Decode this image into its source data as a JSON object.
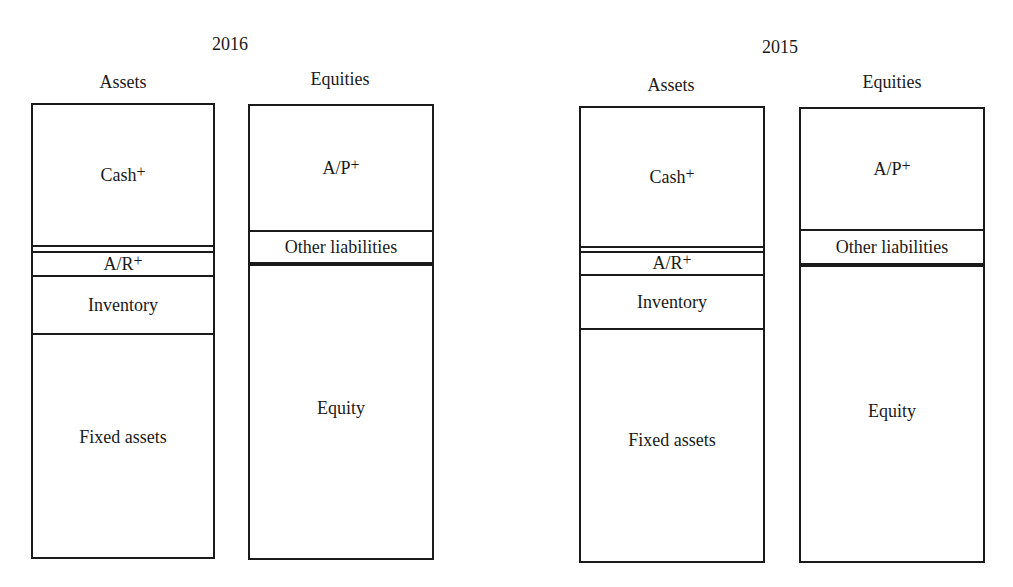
{
  "panels": [
    {
      "year": "2016",
      "assets": {
        "title": "Assets",
        "segments": [
          {
            "label": "Cash",
            "mark": "+"
          },
          {
            "label": "A/R",
            "mark": "+"
          },
          {
            "label": "Inventory",
            "mark": ""
          },
          {
            "label": "Fixed assets",
            "mark": ""
          }
        ]
      },
      "equities": {
        "title": "Equities",
        "segments": [
          {
            "label": "A/P",
            "mark": "+"
          },
          {
            "label": "Other liabilities",
            "mark": ""
          },
          {
            "label": "Equity",
            "mark": ""
          }
        ]
      }
    },
    {
      "year": "2015",
      "assets": {
        "title": "Assets",
        "segments": [
          {
            "label": "Cash",
            "mark": "+"
          },
          {
            "label": "A/R",
            "mark": "+"
          },
          {
            "label": "Inventory",
            "mark": ""
          },
          {
            "label": "Fixed assets",
            "mark": ""
          }
        ]
      },
      "equities": {
        "title": "Equities",
        "segments": [
          {
            "label": "A/P",
            "mark": "+"
          },
          {
            "label": "Other liabilities",
            "mark": ""
          },
          {
            "label": "Equity",
            "mark": ""
          }
        ]
      }
    }
  ]
}
